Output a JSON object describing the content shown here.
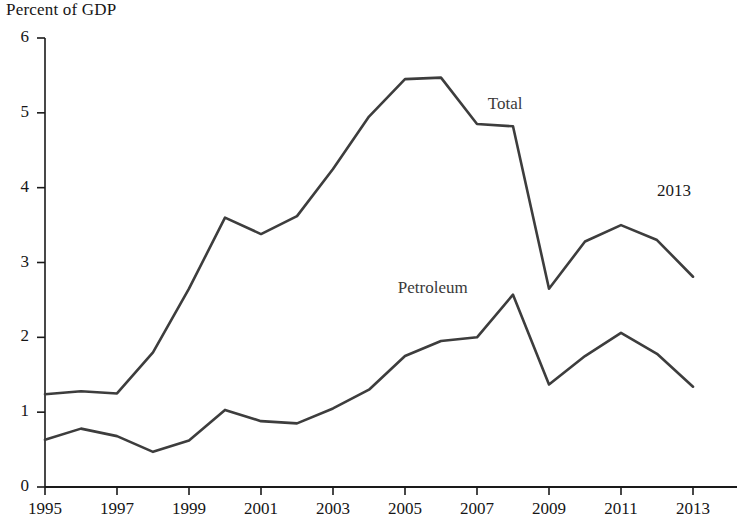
{
  "chart_data": {
    "type": "line",
    "title": "",
    "subtitle": "",
    "ylabel": "Percent of GDP",
    "xlabel": "",
    "ylim": [
      0,
      6
    ],
    "xlim": [
      1995,
      2013
    ],
    "grid": false,
    "legend_position": "inline-annotation",
    "ytick_labels": [
      "0",
      "1",
      "2",
      "3",
      "4",
      "5",
      "6"
    ],
    "ytick_values": [
      0,
      1,
      2,
      3,
      4,
      5,
      6
    ],
    "xtick_labels": [
      "1995",
      "1997",
      "1999",
      "2001",
      "2003",
      "2005",
      "2007",
      "2009",
      "2011",
      "2013"
    ],
    "xtick_values": [
      1995,
      1997,
      1999,
      2001,
      2003,
      2005,
      2007,
      2009,
      2011,
      2013
    ],
    "x": [
      1995,
      1996,
      1997,
      1998,
      1999,
      2000,
      2001,
      2002,
      2003,
      2004,
      2005,
      2006,
      2007,
      2008,
      2009,
      2010,
      2011,
      2012,
      2013
    ],
    "series": [
      {
        "name": "Total",
        "label": "Total",
        "color": "#3d3d3d",
        "values": [
          1.24,
          1.28,
          1.25,
          1.8,
          2.65,
          3.6,
          3.38,
          3.62,
          4.25,
          4.95,
          5.45,
          5.47,
          4.85,
          4.82,
          2.65,
          3.28,
          3.5,
          3.3,
          2.81
        ]
      },
      {
        "name": "Petroleum",
        "label": "Petroleum",
        "color": "#3d3d3d",
        "values": [
          0.63,
          0.78,
          0.68,
          0.47,
          0.62,
          1.03,
          0.88,
          0.85,
          1.05,
          1.3,
          1.75,
          1.95,
          2.0,
          2.57,
          1.37,
          1.75,
          2.06,
          1.78,
          1.34
        ]
      }
    ],
    "annotations": [
      {
        "text": "2013",
        "x": 2012.0,
        "y": 3.95
      }
    ]
  },
  "labels": {
    "y_axis_title": "Percent of GDP",
    "total_label": "Total",
    "petroleum_label": "Petroleum",
    "year_annotation": "2013"
  },
  "colors": {
    "line": "#3d3d3d",
    "axis": "#1a1a1a",
    "background": "#ffffff",
    "text": "#161616"
  }
}
